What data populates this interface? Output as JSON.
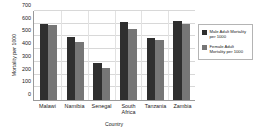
{
  "chart_data": {
    "type": "bar",
    "title": "",
    "xlabel": "Country",
    "ylabel": "Mortality per 1000",
    "categories": [
      "Malawi",
      "Namibia",
      "Senegal",
      "South Africa",
      "Tanzania",
      "Zambia"
    ],
    "category_lines": [
      [
        "Malawi"
      ],
      [
        "Namibia"
      ],
      [
        "Senegal"
      ],
      [
        "South",
        "Africa"
      ],
      [
        "Tanzania"
      ],
      [
        "Zambia"
      ]
    ],
    "series": [
      {
        "name": "Male Adult Mortality per 1000",
        "color": "#2f2f2f",
        "values": [
          600,
          495,
          295,
          615,
          490,
          625
        ]
      },
      {
        "name": "Female Adult Mortality per 1000",
        "color": "#767676",
        "values": [
          590,
          455,
          255,
          555,
          470,
          600
        ]
      }
    ],
    "ylim": [
      0,
      700
    ],
    "yticks": [
      0,
      100,
      200,
      300,
      400,
      500,
      600,
      700
    ],
    "ytick_labels": [
      "0",
      "100",
      "200",
      "300",
      "400",
      "500",
      "600",
      "700"
    ],
    "grid": true,
    "legend_position": "right"
  },
  "legend": {
    "entries": [
      {
        "label": "Male Adult Mortality per 1000"
      },
      {
        "label": "Female Adult Mortality per 1000"
      }
    ]
  }
}
